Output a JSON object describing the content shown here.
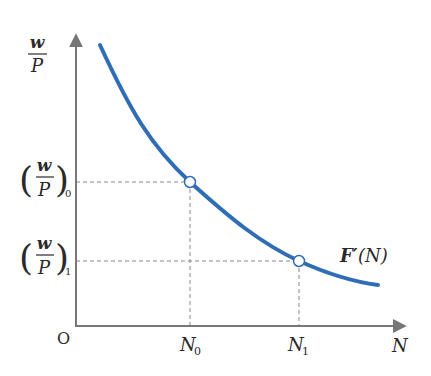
{
  "diagram": {
    "type": "downward-sloping curve with marked points",
    "y_axis_label": {
      "num": "w",
      "den": "P"
    },
    "x_axis_label": "N",
    "origin_label": "O",
    "curve": {
      "label_main": "F′",
      "label_arg": "(N)",
      "color": "#2f6db5"
    },
    "axis_color": "#777777",
    "guide_color": "#888888",
    "points": [
      {
        "x_label": "N",
        "x_sub": "0",
        "y_num": "w",
        "y_den": "P",
        "y_sub": "0"
      },
      {
        "x_label": "N",
        "x_sub": "1",
        "y_num": "w",
        "y_den": "P",
        "y_sub": "1"
      }
    ]
  }
}
